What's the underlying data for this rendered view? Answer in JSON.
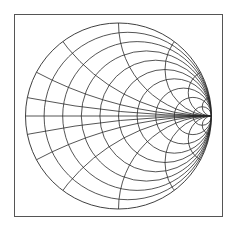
{
  "chart_data": {
    "type": "smith",
    "title": "",
    "center": [
      118.5,
      116
    ],
    "radius": 93,
    "resistance_values": [
      0.111,
      0.25,
      0.4286,
      0.6667,
      1,
      1.5,
      2.333,
      4,
      9
    ],
    "reactance_values": [
      0.1,
      0.25,
      0.5,
      1,
      2,
      4,
      10
    ],
    "reactance_symmetric": true,
    "include_real_axis": true,
    "line_color": "#2a2a2a",
    "frame_color": "#555555",
    "grid": true,
    "labels": []
  }
}
